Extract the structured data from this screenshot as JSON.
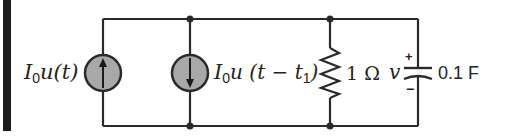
{
  "diagram": {
    "type": "circuit",
    "wire_color": "#2a2a2a",
    "source_fill": "#a8a8a8",
    "components": [
      {
        "id": "source1",
        "kind": "current-source",
        "direction": "up",
        "label": {
          "main": "I",
          "sub": "0",
          "rest": "u(t)"
        }
      },
      {
        "id": "source2",
        "kind": "current-source",
        "direction": "down",
        "label": {
          "main": "I",
          "sub": "0",
          "rest": "u (t − t",
          "sub2": "1",
          "close": ")"
        }
      },
      {
        "id": "resistor",
        "kind": "resistor",
        "label": "1 Ω"
      },
      {
        "id": "capacitor",
        "kind": "capacitor",
        "voltage_label": "v",
        "plus": "+",
        "minus": "−",
        "label": "0.1 F"
      }
    ],
    "nodes": 4
  }
}
